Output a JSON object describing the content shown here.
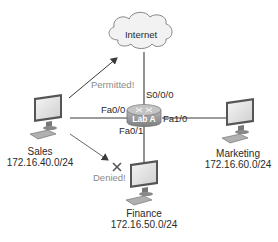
{
  "diagram": {
    "type": "network-topology",
    "colors": {
      "line": "#3a3a3a",
      "cloud_fill": "#f2f2f2",
      "router_fill": "#9a9a9a",
      "router_label": "#ffffff",
      "muted_text": "#8a8a8a"
    },
    "cloud": {
      "label": "Internet"
    },
    "router": {
      "label": "Lab A",
      "interfaces": {
        "s0": "S0/0/0",
        "fa00": "Fa0/0",
        "fa01": "Fa0/1",
        "fa10": "Fa1/0"
      }
    },
    "hosts": [
      {
        "id": "sales",
        "name": "Sales",
        "subnet": "172.16.40.0/24"
      },
      {
        "id": "finance",
        "name": "Finance",
        "subnet": "172.16.50.0/24"
      },
      {
        "id": "marketing",
        "name": "Marketing",
        "subnet": "172.16.60.0/24"
      }
    ],
    "annotations": {
      "permitted": "Permitted!",
      "denied": "Denied!"
    }
  }
}
